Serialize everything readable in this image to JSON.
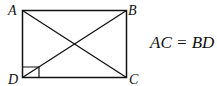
{
  "diagram": {
    "type": "rectangle-with-diagonals",
    "vertices": [
      {
        "label": "A",
        "position": "top-left"
      },
      {
        "label": "B",
        "position": "top-right"
      },
      {
        "label": "C",
        "position": "bottom-right"
      },
      {
        "label": "D",
        "position": "bottom-left"
      }
    ],
    "diagonals": [
      "AC",
      "BD"
    ],
    "right_angle_marker": "D",
    "equation": "AC = BD",
    "stroke_color": "#111111",
    "background": "#ffffff"
  }
}
